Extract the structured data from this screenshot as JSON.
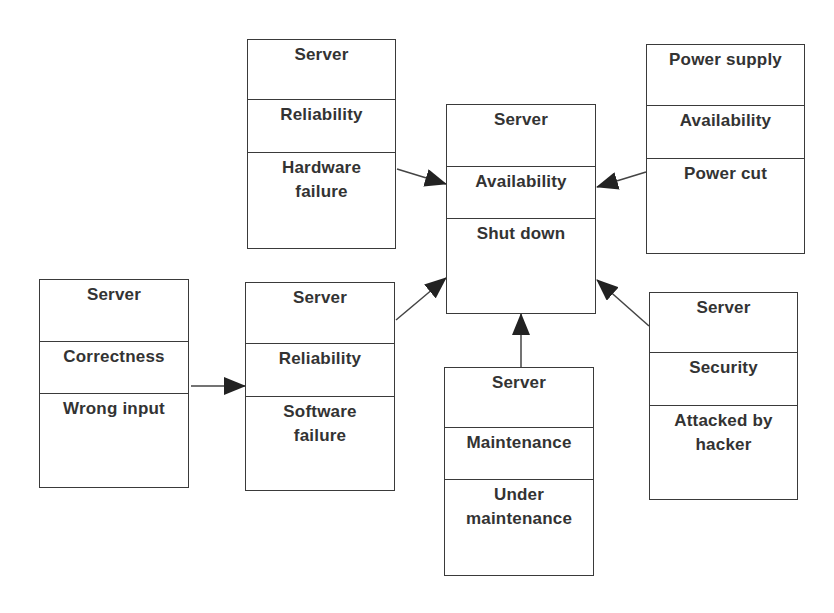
{
  "diagram": {
    "type": "object-attribute-event boxes",
    "colors": {
      "border": "#3a3a3a",
      "text": "#333333",
      "background": "#ffffff"
    },
    "boxes": [
      {
        "id": "hardware",
        "object": "Server",
        "attribute": "Reliability",
        "event_lines": [
          "Hardware",
          "failure"
        ]
      },
      {
        "id": "central",
        "object": "Server",
        "attribute": "Availability",
        "event_lines": [
          "Shut down"
        ]
      },
      {
        "id": "power",
        "object": "Power supply",
        "attribute": "Availability",
        "event_lines": [
          "Power cut"
        ]
      },
      {
        "id": "correctness",
        "object": "Server",
        "attribute": "Correctness",
        "event_lines": [
          "Wrong input"
        ]
      },
      {
        "id": "software",
        "object": "Server",
        "attribute": "Reliability",
        "event_lines": [
          "Software",
          "failure"
        ]
      },
      {
        "id": "maintenance",
        "object": "Server",
        "attribute": "Maintenance",
        "event_lines": [
          "Under",
          "maintenance"
        ]
      },
      {
        "id": "security",
        "object": "Server",
        "attribute": "Security",
        "event_lines": [
          "Attacked by",
          "hacker"
        ]
      }
    ],
    "edges": [
      {
        "from": "hardware",
        "to": "central"
      },
      {
        "from": "power",
        "to": "central"
      },
      {
        "from": "software",
        "to": "central"
      },
      {
        "from": "maintenance",
        "to": "central"
      },
      {
        "from": "security",
        "to": "central"
      },
      {
        "from": "correctness",
        "to": "software"
      }
    ]
  }
}
